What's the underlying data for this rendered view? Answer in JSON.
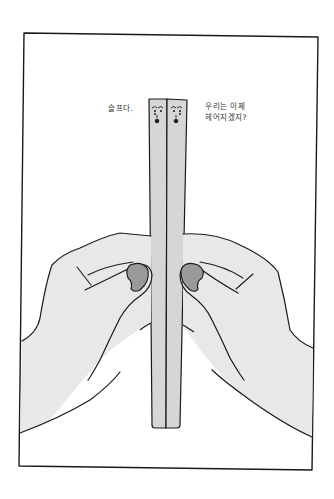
{
  "illustration": {
    "title": "Chopsticks held apart by two hands",
    "captions": {
      "left": "슬프다.",
      "right_line1": "우리는 이제",
      "right_line2": "헤어지겠지?"
    },
    "colors": {
      "background": "#ffffff",
      "outline": "#1a1a1a",
      "skin_fill": "#e8e8e8",
      "chopstick_fill": "#d6d6d6",
      "nail_fill": "#9a9a9a"
    }
  }
}
